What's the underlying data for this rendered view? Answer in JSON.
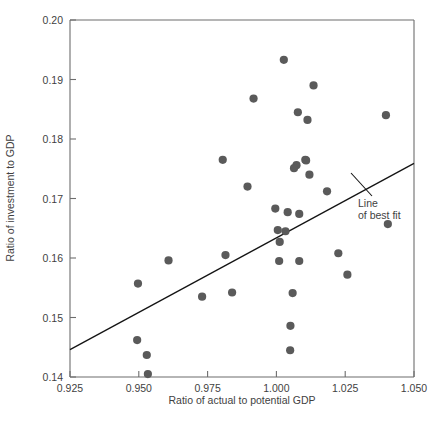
{
  "chart_data": {
    "type": "scatter",
    "title": "",
    "xlabel": "Ratio of actual to potential GDP",
    "ylabel": "Ratio of investment to GDP",
    "xlim": [
      0.925,
      1.05
    ],
    "ylim": [
      0.14,
      0.2
    ],
    "xticks": [
      "0.925",
      "0.950",
      "0.975",
      "1.000",
      "1.025",
      "1.050"
    ],
    "xtick_values": [
      0.925,
      0.95,
      0.975,
      1.0,
      1.025,
      1.05
    ],
    "yticks": [
      "0.14",
      "0.15",
      "0.16",
      "0.17",
      "0.18",
      "0.19",
      "0.20"
    ],
    "ytick_values": [
      0.14,
      0.15,
      0.16,
      0.17,
      0.18,
      0.19,
      0.2
    ],
    "grid": false,
    "legend": "none",
    "marker_color": "#5a5a5a",
    "line_color": "#141414",
    "axis_color": "#6d6d6d",
    "points": [
      {
        "x": 0.9497,
        "y": 0.1557
      },
      {
        "x": 0.9494,
        "y": 0.1462
      },
      {
        "x": 0.9529,
        "y": 0.1437
      },
      {
        "x": 0.9533,
        "y": 0.1405
      },
      {
        "x": 0.9608,
        "y": 0.1596
      },
      {
        "x": 0.973,
        "y": 0.1535
      },
      {
        "x": 0.9805,
        "y": 0.1765
      },
      {
        "x": 0.9815,
        "y": 0.1605
      },
      {
        "x": 0.9839,
        "y": 0.1542
      },
      {
        "x": 0.9895,
        "y": 0.172
      },
      {
        "x": 0.9917,
        "y": 0.1868
      },
      {
        "x": 0.9996,
        "y": 0.1683
      },
      {
        "x": 1.0005,
        "y": 0.1647
      },
      {
        "x": 1.0012,
        "y": 0.1627
      },
      {
        "x": 1.001,
        "y": 0.1595
      },
      {
        "x": 1.0027,
        "y": 0.1933
      },
      {
        "x": 1.0033,
        "y": 0.1645
      },
      {
        "x": 1.0041,
        "y": 0.1677
      },
      {
        "x": 1.0059,
        "y": 0.1541
      },
      {
        "x": 1.0051,
        "y": 0.1486
      },
      {
        "x": 1.005,
        "y": 0.1445
      },
      {
        "x": 1.0073,
        "y": 0.1756
      },
      {
        "x": 1.0064,
        "y": 0.1751
      },
      {
        "x": 1.0083,
        "y": 0.1674
      },
      {
        "x": 1.0083,
        "y": 0.1595
      },
      {
        "x": 1.0078,
        "y": 0.1845
      },
      {
        "x": 1.0105,
        "y": 0.1765
      },
      {
        "x": 1.0108,
        "y": 0.1764
      },
      {
        "x": 1.0113,
        "y": 0.1832
      },
      {
        "x": 1.012,
        "y": 0.174
      },
      {
        "x": 1.0135,
        "y": 0.189
      },
      {
        "x": 1.0184,
        "y": 0.1712
      },
      {
        "x": 1.0225,
        "y": 0.1608
      },
      {
        "x": 1.0258,
        "y": 0.1572
      },
      {
        "x": 1.0398,
        "y": 0.184
      },
      {
        "x": 1.0405,
        "y": 0.1657
      }
    ],
    "fit_line": {
      "label_line1": "Line",
      "label_line2": "of best fit",
      "x1": 0.925,
      "y1": 0.1446,
      "x2": 1.05,
      "y2": 0.1759
    }
  }
}
